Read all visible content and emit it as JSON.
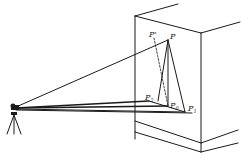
{
  "diagram": {
    "labels": {
      "P": "P",
      "P_prime": "P'",
      "P0": "P",
      "P0_sub": "0",
      "P1": "P",
      "P1_sub": "1",
      "P2": "P",
      "P2_sub": "2"
    },
    "points": {
      "instrument": [
        14,
        108
      ],
      "P": [
        168,
        40
      ],
      "P_prime": [
        152,
        36
      ],
      "P0": [
        168,
        106
      ],
      "P1": [
        185,
        112
      ],
      "P2": [
        149,
        101
      ]
    },
    "colors": {
      "line": "#1a1a1a",
      "background": "#ffffff"
    }
  }
}
